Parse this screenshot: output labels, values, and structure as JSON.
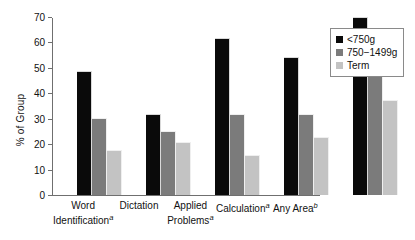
{
  "chart_data": {
    "type": "bar",
    "title": "",
    "subtitle": "",
    "xlabel": "",
    "ylabel": "% of Group",
    "ylim": [
      0,
      70
    ],
    "yticks": [
      0,
      10,
      20,
      30,
      40,
      50,
      60,
      70
    ],
    "grid": false,
    "legend_position": "top-right",
    "categories": [
      "Word Identification",
      "Dictation",
      "Applied Problems",
      "Calculation",
      "Any Area"
    ],
    "category_footnotes": [
      "a",
      "",
      "a",
      "a",
      "b"
    ],
    "category_labels_display": [
      "Word Identificationᵃ",
      "Dictation",
      "Applied Problemsᵃ",
      "Calculationᵃ",
      "Any Areaᵇ"
    ],
    "series": [
      {
        "name": "<750g",
        "color": "#0a0a0a",
        "values": [
          49,
          32,
          62,
          54.5,
          70.5
        ]
      },
      {
        "name": "750−1499g",
        "color": "#7b7b7b",
        "values": [
          30.5,
          25.5,
          32,
          32,
          55.5
        ]
      },
      {
        "name": "Term",
        "color": "#c3c3c3",
        "values": [
          18,
          21,
          16,
          23,
          37.5
        ]
      }
    ]
  },
  "axis": {
    "y_title": "% of Group",
    "ticks": [
      "70",
      "60",
      "50",
      "40",
      "30",
      "20",
      "10",
      "0"
    ]
  },
  "legend": {
    "items": [
      {
        "label": "<750g"
      },
      {
        "label": "750−1499g"
      },
      {
        "label": "Term"
      }
    ]
  },
  "xaxis": {
    "labels": [
      {
        "text": "Word Identification",
        "note": "a",
        "line1": "Word",
        "line2": "Identification"
      },
      {
        "text": "Dictation",
        "note": "",
        "line1": "Dictation",
        "line2": ""
      },
      {
        "text": "Applied Problems",
        "note": "a",
        "line1": "Applied",
        "line2": "Problems"
      },
      {
        "text": "Calculation",
        "note": "a",
        "line1": "Calculation",
        "line2": ""
      },
      {
        "text": "Any Area",
        "note": "b",
        "line1": "Any Area",
        "line2": ""
      }
    ]
  }
}
